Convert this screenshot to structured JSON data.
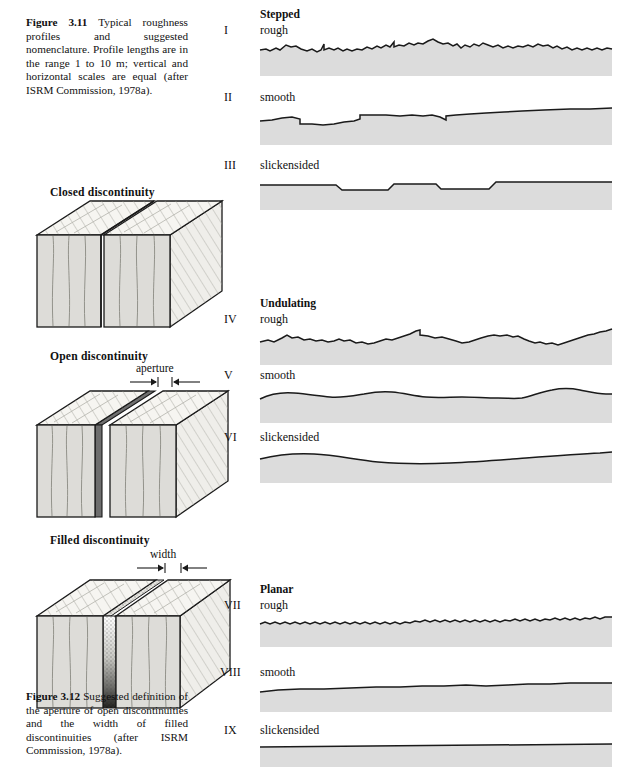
{
  "figure_3_11": {
    "caption_parts": {
      "label": "Figure 3.11",
      "text": "Typical roughness profiles and suggested nomenclature. Profile lengths are in the range 1 to 10 m; vertical and horizontal scales are equal (after ISRM Commission, 1978a)."
    }
  },
  "figure_3_12": {
    "caption_parts": {
      "label": "Figure 3.12",
      "text": "Suggested definition of the aperture of open discontinuities and the width of filled discontinuities (after ISRM Commission, 1978a)."
    }
  },
  "blocks": [
    {
      "heading": "Closed discontinuity",
      "annotation": null
    },
    {
      "heading": "Open discontinuity",
      "annotation": "aperture"
    },
    {
      "heading": "Filled discontinuity",
      "annotation": "width"
    }
  ],
  "profile_groups": [
    {
      "heading": "Stepped",
      "profiles": [
        {
          "numeral": "I",
          "label": "rough"
        },
        {
          "numeral": "II",
          "label": "smooth"
        },
        {
          "numeral": "III",
          "label": "slickensided"
        }
      ]
    },
    {
      "heading": "Undulating",
      "profiles": [
        {
          "numeral": "IV",
          "label": "rough"
        },
        {
          "numeral": "V",
          "label": "smooth"
        },
        {
          "numeral": "VI",
          "label": "slickensided"
        }
      ]
    },
    {
      "heading": "Planar",
      "profiles": [
        {
          "numeral": "VII",
          "label": "rough"
        },
        {
          "numeral": "VIII",
          "label": "smooth"
        },
        {
          "numeral": "IX",
          "label": "slickensided"
        }
      ]
    }
  ],
  "colors": {
    "rock_fill": "#dcdcdc",
    "profile_line": "#1a1a1a",
    "block_top": "#f5f4f0",
    "block_front": "#dddcd8",
    "block_side": "#efeeea",
    "aperture_gap": "#6f6f6f",
    "paper": "#ffffff"
  }
}
